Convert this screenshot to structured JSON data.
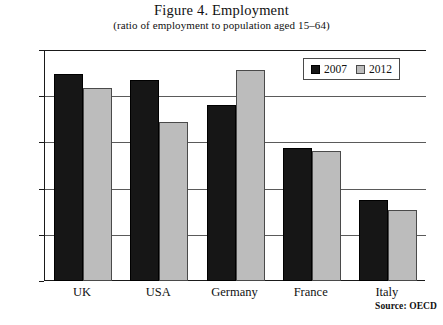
{
  "chart_data": {
    "type": "bar",
    "title": "Figure 4. Employment",
    "subtitle": "(ratio of employment to population aged 15–64)",
    "xlabel": "",
    "ylabel": "",
    "ylim": [
      50.0,
      75.0
    ],
    "yticks": [
      "50.0",
      "55.0",
      "60.0",
      "65.0",
      "70.0",
      "75.0"
    ],
    "ytick_values": [
      50.0,
      55.0,
      60.0,
      65.0,
      70.0,
      75.0
    ],
    "grid": true,
    "legend_position": "top-right",
    "categories": [
      "UK",
      "USA",
      "Germany",
      "France",
      "Italy"
    ],
    "series": [
      {
        "name": "2007",
        "color": "#161616",
        "values": [
          72.4,
          71.8,
          69.1,
          64.4,
          58.8
        ]
      },
      {
        "name": "2012",
        "color": "#bcbcbc",
        "values": [
          70.9,
          67.2,
          72.8,
          64.1,
          57.7
        ]
      }
    ],
    "source": "Source: OECD"
  }
}
